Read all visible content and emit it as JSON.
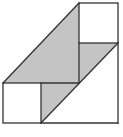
{
  "diagram": {
    "type": "geometry-figure",
    "colors": {
      "stroke": "#333333",
      "shade": "#c4c4c4",
      "background": "#ffffff"
    },
    "shapes": {
      "top_right_square": {
        "x": 79,
        "y": 3,
        "size": 40
      },
      "bottom_left_square": {
        "x": 3,
        "y": 83,
        "size": 40
      }
    }
  }
}
